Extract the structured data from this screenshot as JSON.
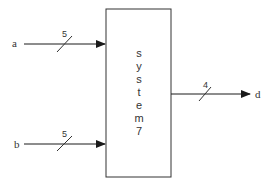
{
  "block": {
    "label_chars": [
      "s",
      "y",
      "s",
      "t",
      "e",
      "m",
      "7"
    ],
    "label": "system7"
  },
  "inputs": [
    {
      "name": "a",
      "width": "5"
    },
    {
      "name": "b",
      "width": "5"
    }
  ],
  "outputs": [
    {
      "name": "d",
      "width": "4"
    }
  ],
  "colors": {
    "line": "#1a1a1a",
    "box": "#333333",
    "text": "#333333"
  }
}
